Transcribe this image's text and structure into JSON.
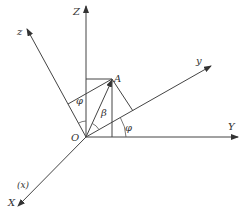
{
  "diagram": {
    "type": "coordinate-axes-3d",
    "origin_label": "O",
    "point_label": "A",
    "axes": {
      "fixed": [
        {
          "name": "Z",
          "direction": "up"
        },
        {
          "name": "Y",
          "direction": "right"
        },
        {
          "name": "X",
          "direction": "down-left",
          "alias": "(x)"
        }
      ],
      "rotated": [
        {
          "name": "z",
          "direction": "up-left"
        },
        {
          "name": "y",
          "direction": "up-right"
        }
      ]
    },
    "angles": [
      {
        "symbol": "φ",
        "between": "Z and z"
      },
      {
        "symbol": "β",
        "between": "OA and y"
      },
      {
        "symbol": "φ",
        "between": "Y and y"
      }
    ],
    "labels": {
      "Z": "Z",
      "z": "z",
      "A": "A",
      "y": "y",
      "Y": "Y",
      "O": "O",
      "X": "X",
      "x_alias": "(x)",
      "phi_top": "φ",
      "beta": "β",
      "phi_right": "φ"
    },
    "colors": {
      "line": "#444444",
      "text": "#333333",
      "background": "#ffffff"
    }
  }
}
